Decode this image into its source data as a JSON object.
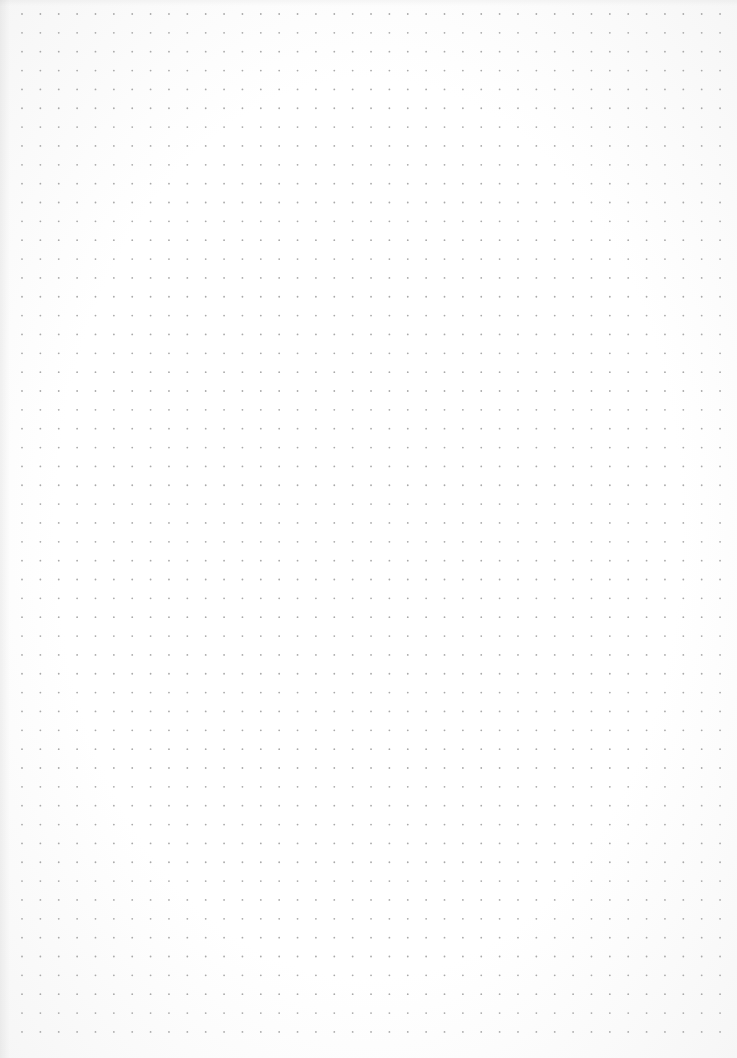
{
  "page": {
    "type": "dot-grid-paper",
    "background_color": "#fdfdfd",
    "dot_color": "#a9a9a9",
    "dot_radius": 0.9,
    "grid": {
      "origin_x": 22,
      "origin_y": 14,
      "spacing_x": 18.37,
      "spacing_y": 18.85,
      "columns": 39,
      "rows": 55
    }
  }
}
